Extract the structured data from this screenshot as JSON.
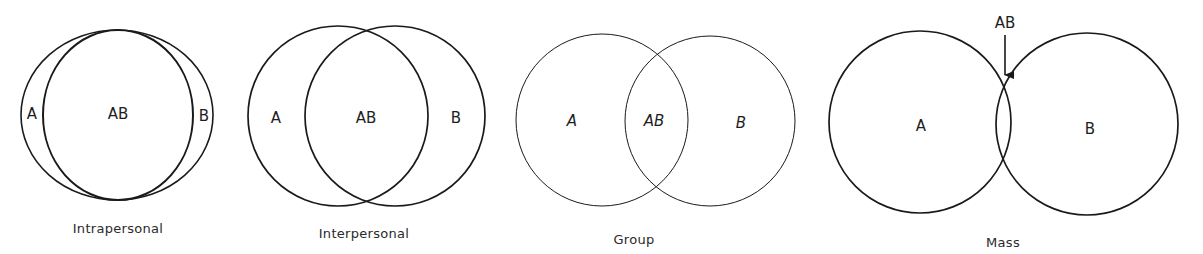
{
  "figure": {
    "panels": [
      {
        "id": "intrapersonal",
        "caption": "Intrapersonal",
        "labels": {
          "a": "A",
          "ab": "AB",
          "b": "B"
        },
        "overlap": "near-total"
      },
      {
        "id": "interpersonal",
        "caption": "Interpersonal",
        "labels": {
          "a": "A",
          "ab": "AB",
          "b": "B"
        },
        "overlap": "large"
      },
      {
        "id": "group",
        "caption": "Group",
        "labels": {
          "a": "A",
          "ab": "AB",
          "b": "B"
        },
        "overlap": "moderate"
      },
      {
        "id": "mass",
        "caption": "Mass",
        "labels": {
          "a": "A",
          "ab": "AB",
          "b": "B"
        },
        "overlap": "small",
        "ab_callout": true
      }
    ]
  },
  "colors": {
    "stroke": "#1a1a1a",
    "text": "#1e1e1e",
    "background": "#ffffff"
  }
}
